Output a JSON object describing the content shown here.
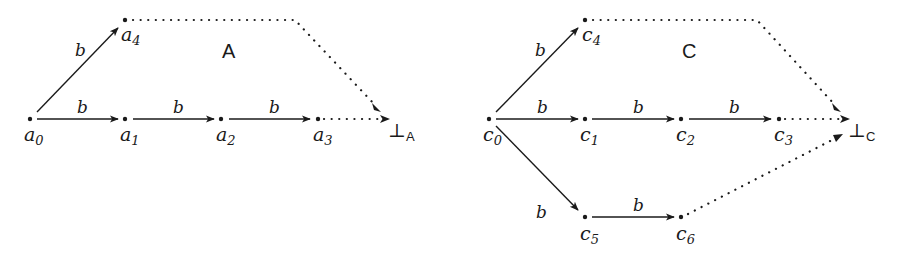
{
  "diagrams": [
    {
      "title": "A",
      "bottom_label": {
        "symbol": "⊥",
        "subscript": "A"
      },
      "nodes": [
        {
          "id": "a0",
          "base": "a",
          "sub": "0"
        },
        {
          "id": "a1",
          "base": "a",
          "sub": "1"
        },
        {
          "id": "a2",
          "base": "a",
          "sub": "2"
        },
        {
          "id": "a3",
          "base": "a",
          "sub": "3"
        },
        {
          "id": "a4",
          "base": "a",
          "sub": "4"
        }
      ],
      "edges": [
        {
          "from": "a0",
          "to": "a4",
          "label": "b",
          "style": "solid"
        },
        {
          "from": "a0",
          "to": "a1",
          "label": "b",
          "style": "solid"
        },
        {
          "from": "a1",
          "to": "a2",
          "label": "b",
          "style": "solid"
        },
        {
          "from": "a2",
          "to": "a3",
          "label": "b",
          "style": "solid"
        },
        {
          "from": "a3",
          "to": "⊥A",
          "label": "",
          "style": "dotted"
        },
        {
          "from": "a4",
          "to": "⊥A",
          "label": "",
          "style": "dotted"
        }
      ]
    },
    {
      "title": "C",
      "bottom_label": {
        "symbol": "⊥",
        "subscript": "C"
      },
      "nodes": [
        {
          "id": "c0",
          "base": "c",
          "sub": "0"
        },
        {
          "id": "c1",
          "base": "c",
          "sub": "1"
        },
        {
          "id": "c2",
          "base": "c",
          "sub": "2"
        },
        {
          "id": "c3",
          "base": "c",
          "sub": "3"
        },
        {
          "id": "c4",
          "base": "c",
          "sub": "4"
        },
        {
          "id": "c5",
          "base": "c",
          "sub": "5"
        },
        {
          "id": "c6",
          "base": "c",
          "sub": "6"
        }
      ],
      "edges": [
        {
          "from": "c0",
          "to": "c4",
          "label": "b",
          "style": "solid"
        },
        {
          "from": "c0",
          "to": "c1",
          "label": "b",
          "style": "solid"
        },
        {
          "from": "c1",
          "to": "c2",
          "label": "b",
          "style": "solid"
        },
        {
          "from": "c2",
          "to": "c3",
          "label": "b",
          "style": "solid"
        },
        {
          "from": "c0",
          "to": "c5",
          "label": "b",
          "style": "solid"
        },
        {
          "from": "c5",
          "to": "c6",
          "label": "b",
          "style": "solid"
        },
        {
          "from": "c3",
          "to": "⊥C",
          "label": "",
          "style": "dotted"
        },
        {
          "from": "c4",
          "to": "⊥C",
          "label": "",
          "style": "dotted"
        },
        {
          "from": "c6",
          "to": "⊥C",
          "label": "",
          "style": "dotted"
        }
      ]
    }
  ]
}
